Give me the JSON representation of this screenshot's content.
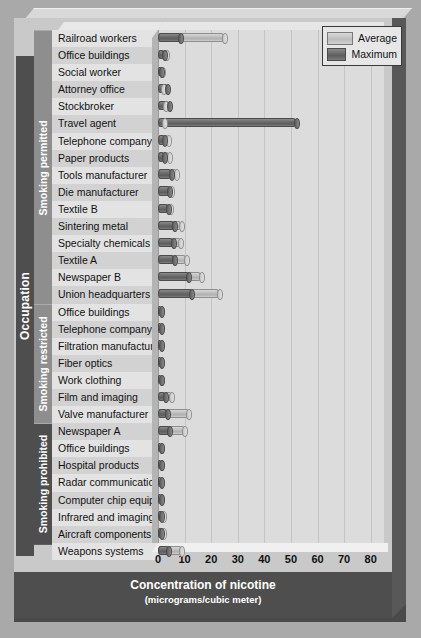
{
  "legend": {
    "position": "top-right",
    "entries": [
      {
        "label": "Average",
        "swatch": "avg"
      },
      {
        "label": "Maximum",
        "swatch": "max"
      }
    ]
  },
  "axes": {
    "y_axis_title": "Occupation",
    "x_axis_title": "Concentration of nicotine",
    "x_axis_subtitle": "(micrograms/cubic meter)",
    "x_ticks": [
      "0",
      "10",
      "20",
      "30",
      "40",
      "50",
      "60",
      "70",
      "80"
    ]
  },
  "groups": [
    {
      "label": "Smoking permitted",
      "count": 16
    },
    {
      "label": "Smoking restricted",
      "count": 7
    },
    {
      "label": "Smoking prohibited",
      "count": 7
    }
  ],
  "chart_data": {
    "type": "bar",
    "orientation": "horizontal",
    "title": "",
    "xlabel": "Concentration of nicotine (micrograms/cubic meter)",
    "ylabel": "Occupation",
    "xlim": [
      0,
      85
    ],
    "grid": true,
    "categories": [
      "Railroad workers",
      "Office buildings",
      "Social worker",
      "Attorney office",
      "Stockbroker",
      "Travel agent",
      "Telephone company",
      "Paper products",
      "Tools manufacturer",
      "Die manufacturer",
      "Textile B",
      "Sintering metal",
      "Specialty chemicals",
      "Textile A",
      "Newspaper B",
      "Union headquarters",
      "Office buildings",
      "Telephone company",
      "Filtration manufacturer",
      "Fiber optics",
      "Work clothing",
      "Film and imaging",
      "Valve manufacturer",
      "Newspaper A",
      "Office buildings",
      "Hospital products",
      "Radar communications",
      "Computer chip equip.",
      "Infrared and imaging",
      "Aircraft components",
      "Weapons systems"
    ],
    "series": [
      {
        "name": "Average",
        "values": [
          25.0,
          3.3,
          1.6,
          2.0,
          2.8,
          2.6,
          4.0,
          4.3,
          7.0,
          5.0,
          4.6,
          8.8,
          8.5,
          10.6,
          16.2,
          23.0,
          0.9,
          0.9,
          0.9,
          0.6,
          0.8,
          5.1,
          11.5,
          10.0,
          0.8,
          0.7,
          0.9,
          0.5,
          2.2,
          2.2,
          9.0
        ]
      },
      {
        "name": "Maximum",
        "values": [
          8.6,
          2.3,
          1.5,
          3.6,
          4.3,
          52.0,
          2.6,
          2.3,
          5.0,
          4.5,
          3.9,
          6.2,
          5.8,
          6.1,
          11.6,
          12.6,
          0.6,
          0.6,
          0.6,
          0.4,
          0.5,
          2.8,
          3.5,
          4.4,
          0.5,
          0.4,
          0.6,
          0.3,
          1.4,
          1.4,
          4.0
        ]
      }
    ]
  }
}
